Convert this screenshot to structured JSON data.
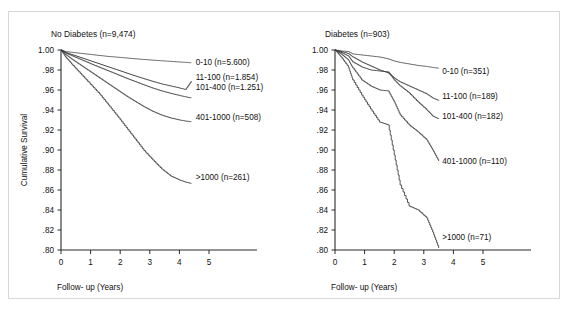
{
  "figure": {
    "background": "#ffffff",
    "border_color": "#d8d8d8",
    "curve_color": "#3a3a3a"
  },
  "chart_data": [
    {
      "type": "line",
      "title": "No Diabetes (n=9,474)",
      "xlabel": "Follow- up (Years)",
      "ylabel": "Cumulative Survival",
      "xlim": [
        0,
        5
      ],
      "ylim": [
        0.8,
        1.0
      ],
      "grid": false,
      "legend_position": "right-inline",
      "xticks": [
        "0",
        "1",
        "2",
        "3",
        "4",
        "5"
      ],
      "xtick_values": [
        0,
        1,
        2,
        3,
        4,
        5
      ],
      "yticks": [
        "1.00",
        ".98",
        ".96",
        ".94",
        ".92",
        ".90",
        ".88",
        ".86",
        ".84",
        ".82",
        ".80"
      ],
      "ytick_values": [
        1.0,
        0.98,
        0.96,
        0.94,
        0.92,
        0.9,
        0.88,
        0.86,
        0.84,
        0.82,
        0.8
      ],
      "series": [
        {
          "name": "0-10 (n=5.600)",
          "label_x": 4.55,
          "label_y": 0.9885,
          "x": [
            0,
            0.15,
            0.4,
            0.7,
            1.0,
            1.3,
            1.6,
            1.9,
            2.2,
            2.5,
            2.8,
            3.1,
            3.4,
            3.7,
            4.0,
            4.2,
            4.4
          ],
          "values": [
            1.0,
            0.9985,
            0.9975,
            0.9965,
            0.9955,
            0.9945,
            0.9935,
            0.9928,
            0.992,
            0.9912,
            0.9905,
            0.9898,
            0.9892,
            0.9886,
            0.988,
            0.9876,
            0.9872
          ]
        },
        {
          "name": "11-100 (n=1.854)",
          "label_x": 4.55,
          "label_y": 0.9735,
          "x": [
            0,
            0.15,
            0.4,
            0.7,
            1.0,
            1.3,
            1.6,
            1.9,
            2.2,
            2.5,
            2.8,
            3.1,
            3.4,
            3.7,
            4.0,
            4.2,
            4.4
          ],
          "values": [
            1.0,
            0.9975,
            0.995,
            0.992,
            0.989,
            0.986,
            0.983,
            0.98,
            0.977,
            0.974,
            0.9712,
            0.9685,
            0.966,
            0.964,
            0.962,
            0.9605,
            0.969
          ]
        },
        {
          "name": "101-400 (n=1.251)",
          "label_x": 4.55,
          "label_y": 0.9635,
          "x": [
            0,
            0.15,
            0.4,
            0.7,
            1.0,
            1.3,
            1.6,
            1.9,
            2.2,
            2.5,
            2.8,
            3.1,
            3.4,
            3.7,
            4.0,
            4.2,
            4.4
          ],
          "values": [
            1.0,
            0.997,
            0.9938,
            0.99,
            0.9862,
            0.9826,
            0.979,
            0.9754,
            0.9718,
            0.9684,
            0.965,
            0.9618,
            0.959,
            0.9566,
            0.9545,
            0.9532,
            0.952
          ]
        },
        {
          "name": "401-1000 (n=508)",
          "label_x": 4.55,
          "label_y": 0.9335,
          "x": [
            0,
            0.15,
            0.4,
            0.7,
            1.0,
            1.3,
            1.6,
            1.9,
            2.2,
            2.5,
            2.8,
            3.1,
            3.4,
            3.7,
            4.0,
            4.2,
            4.4
          ],
          "values": [
            1.0,
            0.9955,
            0.99,
            0.984,
            0.978,
            0.972,
            0.966,
            0.96,
            0.954,
            0.9485,
            0.9432,
            0.9385,
            0.9348,
            0.932,
            0.93,
            0.929,
            0.9282
          ]
        },
        {
          "name": ">1000 (n=261)",
          "label_x": 4.55,
          "label_y": 0.8735,
          "x": [
            0,
            0.15,
            0.4,
            0.7,
            1.0,
            1.3,
            1.6,
            1.9,
            2.2,
            2.5,
            2.8,
            3.1,
            3.4,
            3.7,
            4.0,
            4.2,
            4.4
          ],
          "values": [
            1.0,
            0.993,
            0.9845,
            0.975,
            0.9655,
            0.956,
            0.945,
            0.934,
            0.9225,
            0.911,
            0.8995,
            0.89,
            0.881,
            0.874,
            0.87,
            0.868,
            0.8665
          ]
        }
      ]
    },
    {
      "type": "line",
      "title": "Diabetes (n=903)",
      "xlabel": "Follow- up (Years)",
      "ylabel": "",
      "xlim": [
        0,
        5
      ],
      "ylim": [
        0.8,
        1.0
      ],
      "grid": false,
      "legend_position": "right-inline",
      "xticks": [
        "0",
        "1",
        "2",
        "3",
        "4",
        "5"
      ],
      "xtick_values": [
        0,
        1,
        2,
        3,
        4,
        5
      ],
      "yticks": [
        "1.00",
        ".98",
        ".96",
        ".94",
        ".92",
        ".90",
        ".88",
        ".86",
        ".84",
        ".82",
        ".80"
      ],
      "ytick_values": [
        1.0,
        0.98,
        0.96,
        0.94,
        0.92,
        0.9,
        0.88,
        0.86,
        0.84,
        0.82,
        0.8
      ],
      "series": [
        {
          "name": "0-10 (n=351)",
          "label_x": 3.62,
          "label_y": 0.979,
          "x": [
            0,
            0.2,
            0.45,
            0.6,
            0.9,
            1.2,
            1.5,
            1.8,
            2.0,
            2.2,
            2.5,
            2.8,
            3.1,
            3.3,
            3.5
          ],
          "values": [
            1.0,
            0.999,
            0.9985,
            0.996,
            0.995,
            0.994,
            0.993,
            0.991,
            0.989,
            0.9875,
            0.986,
            0.9845,
            0.9835,
            0.9825,
            0.9818
          ]
        },
        {
          "name": "11-100 (n=189)",
          "label_x": 3.62,
          "label_y": 0.954,
          "x": [
            0,
            0.2,
            0.45,
            0.6,
            0.9,
            1.2,
            1.5,
            1.8,
            2.0,
            2.2,
            2.5,
            2.8,
            3.1,
            3.3,
            3.5
          ],
          "values": [
            1.0,
            0.9985,
            0.9965,
            0.993,
            0.988,
            0.984,
            0.98,
            0.977,
            0.972,
            0.968,
            0.964,
            0.96,
            0.956,
            0.952,
            0.9495
          ]
        },
        {
          "name": "101-400 (n=182)",
          "label_x": 3.62,
          "label_y": 0.934,
          "x": [
            0,
            0.2,
            0.45,
            0.6,
            0.9,
            1.2,
            1.5,
            1.8,
            2.0,
            2.2,
            2.5,
            2.8,
            3.1,
            3.3,
            3.5
          ],
          "values": [
            1.0,
            0.9975,
            0.994,
            0.988,
            0.983,
            0.98,
            0.979,
            0.978,
            0.97,
            0.964,
            0.957,
            0.948,
            0.94,
            0.934,
            0.931
          ]
        },
        {
          "name": "401-1000 (n=110)",
          "label_x": 3.62,
          "label_y": 0.889,
          "x": [
            0,
            0.2,
            0.45,
            0.6,
            0.9,
            1.2,
            1.5,
            1.8,
            2.0,
            2.2,
            2.5,
            2.8,
            3.1,
            3.3,
            3.5
          ],
          "values": [
            1.0,
            0.996,
            0.99,
            0.982,
            0.97,
            0.964,
            0.96,
            0.959,
            0.948,
            0.935,
            0.925,
            0.918,
            0.91,
            0.9,
            0.889
          ]
        },
        {
          "name": ">1000 (n=71)",
          "label_x": 3.62,
          "label_y": 0.813,
          "x": [
            0,
            0.2,
            0.45,
            0.6,
            0.9,
            1.2,
            1.5,
            1.8,
            2.0,
            2.2,
            2.5,
            2.8,
            3.1,
            3.3,
            3.5
          ],
          "values": [
            1.0,
            0.993,
            0.983,
            0.97,
            0.955,
            0.941,
            0.928,
            0.925,
            0.895,
            0.865,
            0.844,
            0.84,
            0.832,
            0.818,
            0.802
          ]
        }
      ]
    }
  ]
}
